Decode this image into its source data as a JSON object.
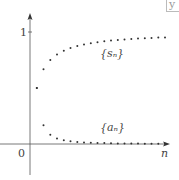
{
  "chart_data": {
    "type": "scatter",
    "title": "",
    "xlabel": "n",
    "ylabel": "",
    "x_tick_labels": [
      "0"
    ],
    "y_tick_labels": [
      "1"
    ],
    "grid": false,
    "legend": "inline labels",
    "x": [
      1,
      2,
      3,
      4,
      5,
      6,
      7,
      8,
      9,
      10,
      11,
      12,
      13,
      14,
      15,
      16,
      17,
      18,
      19,
      20
    ],
    "series": [
      {
        "name": "{s_n}",
        "label": "{sₙ}",
        "values": [
          0.5,
          0.667,
          0.75,
          0.8,
          0.833,
          0.857,
          0.875,
          0.889,
          0.9,
          0.909,
          0.917,
          0.923,
          0.929,
          0.933,
          0.938,
          0.941,
          0.944,
          0.947,
          0.95,
          0.952
        ]
      },
      {
        "name": "{a_n}",
        "label": "{aₙ}",
        "values": [
          0.5,
          0.167,
          0.083,
          0.05,
          0.033,
          0.024,
          0.018,
          0.014,
          0.011,
          0.009,
          0.008,
          0.006,
          0.005,
          0.005,
          0.004,
          0.004,
          0.003,
          0.003,
          0.003,
          0.002
        ]
      }
    ],
    "ylim": [
      -0.28,
      1.16
    ],
    "xlim": [
      0,
      21
    ]
  },
  "labels": {
    "origin": "0",
    "y_one": "1",
    "x_axis": "n",
    "s_series": "{sₙ}",
    "a_series": "{aₙ}",
    "corner_glyph": "y"
  },
  "colors": {
    "axis": "#555555",
    "points": "#333333"
  }
}
